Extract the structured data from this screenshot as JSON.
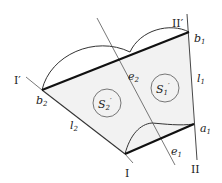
{
  "diagram": {
    "type": "geometric construction",
    "colors": {
      "stroke": "#333333",
      "fill": "#f2f2f2",
      "background": "#ffffff"
    },
    "labels": {
      "I_prime": "I′",
      "II_prime": "II′",
      "I": "I",
      "II": "II",
      "b1": "b",
      "b1_sub": "1",
      "b2": "b",
      "b2_sub": "2",
      "a1": "a",
      "a1_sub": "1",
      "e1": "e",
      "e1_sub": "1",
      "e2": "e",
      "e2_sub": "2",
      "l1": "l",
      "l1_sub": "1",
      "l2": "l",
      "l2_sub": "2",
      "S1": "S",
      "S1_sub": "1",
      "S1_prime": "′",
      "S2": "S",
      "S2_sub": "2",
      "S2_prime": "′"
    },
    "points": {
      "b2": [
        42,
        90
      ],
      "b1": [
        189,
        32
      ],
      "a1": [
        194,
        124
      ],
      "I": [
        125,
        154
      ]
    },
    "segments": [
      {
        "from": "b2",
        "to": "b1",
        "weight": "thick"
      },
      {
        "from": "I",
        "to": "a1",
        "weight": "thick"
      },
      {
        "from": "b2",
        "to": "I",
        "weight": "thin",
        "label": "l2"
      },
      {
        "from": "b1",
        "to": "a1",
        "weight": "thin",
        "label": "l1"
      }
    ],
    "circles": [
      {
        "name": "S2'",
        "cx": 107,
        "cy": 103,
        "r": 14
      },
      {
        "name": "S1'",
        "cx": 165,
        "cy": 88,
        "r": 14
      }
    ]
  }
}
